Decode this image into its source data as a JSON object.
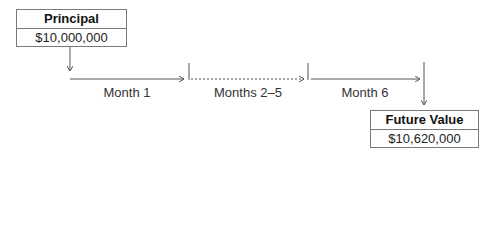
{
  "principal": {
    "title": "Principal",
    "value": "$10,000,000"
  },
  "future_value": {
    "title": "Future Value",
    "value": "$10,620,000"
  },
  "segments": [
    {
      "label": "Month 1",
      "style": "solid"
    },
    {
      "label": "Months 2–5",
      "style": "dotted"
    },
    {
      "label": "Month 6",
      "style": "solid"
    }
  ],
  "colors": {
    "line": "#555555",
    "border": "#7a7a7a"
  }
}
